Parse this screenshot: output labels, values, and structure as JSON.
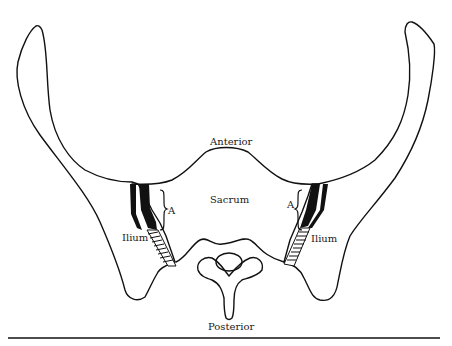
{
  "figure": {
    "labels": {
      "anterior": "Anterior",
      "sacrum": "Sacrum",
      "posterior": "Posterior",
      "ilium_left": "Ilium",
      "ilium_right": "Ilium",
      "a_left": "A",
      "a_right": "A"
    },
    "colors": {
      "line": "#111111",
      "background": "#ffffff"
    }
  }
}
